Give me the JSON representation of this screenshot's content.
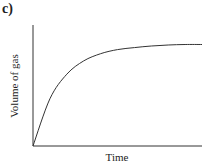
{
  "panel_label": "c)",
  "chart_data": {
    "type": "line",
    "title": "",
    "xlabel": "Time",
    "ylabel": "Volume of gas",
    "x_ticks": [],
    "y_ticks": [],
    "grid": false,
    "legend": null,
    "series": [
      {
        "name": "volume",
        "description": "Rapid initial increase from origin, decelerating and levelling off to a plateau",
        "x": [
          0,
          0.1,
          0.2,
          0.3,
          0.4,
          0.5,
          0.6,
          0.7,
          0.8,
          0.9,
          1.0
        ],
        "y": [
          0,
          0.46,
          0.7,
          0.83,
          0.9,
          0.94,
          0.96,
          0.975,
          0.985,
          0.99,
          0.99
        ]
      }
    ],
    "xlim": [
      0,
      1
    ],
    "ylim": [
      0,
      1.18
    ]
  },
  "colors": {
    "axis": "#333333",
    "curve": "#333333"
  }
}
